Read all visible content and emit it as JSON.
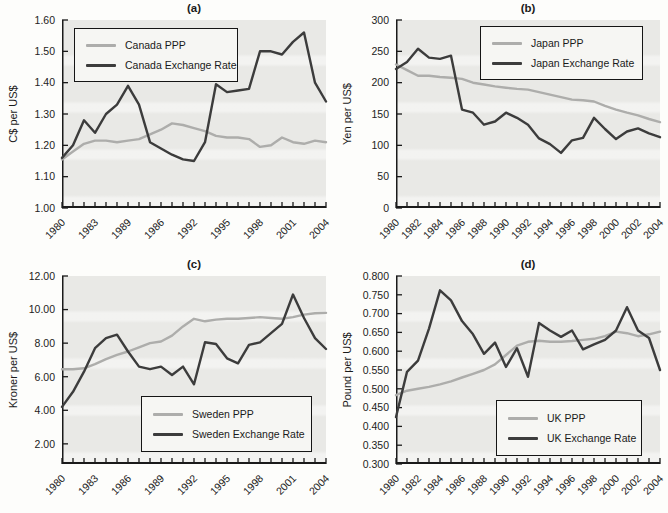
{
  "colors": {
    "ppp": "#adadab",
    "exchange": "#3c3c3c",
    "plot_bg": "#e9e9e6",
    "axis": "#1a1a1a",
    "text": "#222222"
  },
  "chart_data": [
    {
      "id": "a",
      "type": "line",
      "title": "(a)",
      "ylabel": "C$ per US$",
      "xlim": [
        1980,
        2004
      ],
      "ylim": [
        1.0,
        1.6
      ],
      "x_start": 1980,
      "x_step": 1,
      "grid": false,
      "legend_position": "top-left",
      "yticks": [
        {
          "v": 1.0,
          "label": "1.00"
        },
        {
          "v": 1.1,
          "label": "1.10"
        },
        {
          "v": 1.2,
          "label": "1.20"
        },
        {
          "v": 1.3,
          "label": "1.30"
        },
        {
          "v": 1.4,
          "label": "1.40"
        },
        {
          "v": 1.5,
          "label": "1.50"
        },
        {
          "v": 1.6,
          "label": "1.60"
        }
      ],
      "xticks": [
        {
          "pos": 1980,
          "label": "1980"
        },
        {
          "pos": 1983,
          "label": "1983"
        },
        {
          "pos": 1986,
          "label": "1989"
        },
        {
          "pos": 1989,
          "label": "1986"
        },
        {
          "pos": 1992,
          "label": "1992"
        },
        {
          "pos": 1995,
          "label": "1995"
        },
        {
          "pos": 1998,
          "label": "1998"
        },
        {
          "pos": 2001,
          "label": "2001"
        },
        {
          "pos": 2004,
          "label": "2004"
        }
      ],
      "series": [
        {
          "name": "Canada PPP",
          "color_key": "ppp",
          "values": [
            1.155,
            1.18,
            1.205,
            1.215,
            1.215,
            1.21,
            1.215,
            1.22,
            1.235,
            1.25,
            1.27,
            1.265,
            1.255,
            1.245,
            1.23,
            1.225,
            1.225,
            1.22,
            1.195,
            1.2,
            1.225,
            1.21,
            1.205,
            1.215,
            1.21
          ]
        },
        {
          "name": "Canada Exchange Rate",
          "color_key": "exchange",
          "values": [
            1.16,
            1.2,
            1.28,
            1.24,
            1.3,
            1.33,
            1.39,
            1.33,
            1.21,
            1.19,
            1.17,
            1.155,
            1.15,
            1.21,
            1.395,
            1.37,
            1.375,
            1.38,
            1.5,
            1.5,
            1.49,
            1.53,
            1.56,
            1.4,
            1.34
          ]
        }
      ]
    },
    {
      "id": "b",
      "type": "line",
      "title": "(b)",
      "ylabel": "Yen per US$",
      "xlim": [
        1980,
        2004
      ],
      "ylim": [
        0,
        300
      ],
      "x_start": 1980,
      "x_step": 1,
      "grid": false,
      "legend_position": "top-right",
      "yticks": [
        {
          "v": 0,
          "label": "0"
        },
        {
          "v": 50,
          "label": "50"
        },
        {
          "v": 100,
          "label": "100"
        },
        {
          "v": 150,
          "label": "150"
        },
        {
          "v": 200,
          "label": "200"
        },
        {
          "v": 250,
          "label": "250"
        },
        {
          "v": 300,
          "label": "300"
        }
      ],
      "xticks": [
        {
          "pos": 1980,
          "label": "1980"
        },
        {
          "pos": 1982,
          "label": "1982"
        },
        {
          "pos": 1984,
          "label": "1984"
        },
        {
          "pos": 1986,
          "label": "1986"
        },
        {
          "pos": 1988,
          "label": "1988"
        },
        {
          "pos": 1990,
          "label": "1990"
        },
        {
          "pos": 1992,
          "label": "1992"
        },
        {
          "pos": 1994,
          "label": "1994"
        },
        {
          "pos": 1996,
          "label": "1996"
        },
        {
          "pos": 1998,
          "label": "1998"
        },
        {
          "pos": 2000,
          "label": "2000"
        },
        {
          "pos": 2002,
          "label": "2002"
        },
        {
          "pos": 2004,
          "label": "2004"
        }
      ],
      "series": [
        {
          "name": "Japan PPP",
          "color_key": "ppp",
          "values": [
            229,
            220,
            211,
            211,
            209,
            208,
            206,
            200,
            197,
            194,
            192,
            190,
            189,
            185,
            181,
            177,
            173,
            172,
            170,
            163,
            157,
            152,
            148,
            142,
            137
          ]
        },
        {
          "name": "Japan Exchange Rate",
          "color_key": "exchange",
          "values": [
            222,
            233,
            254,
            240,
            238,
            243,
            157,
            152,
            133,
            138,
            152,
            144,
            133,
            111,
            102,
            88,
            108,
            112,
            144,
            126,
            110,
            122,
            127,
            119,
            113
          ]
        }
      ]
    },
    {
      "id": "c",
      "type": "line",
      "title": "(c)",
      "ylabel": "Kroner per US$",
      "xlim": [
        1980,
        2004
      ],
      "ylim": [
        0.8,
        12.0
      ],
      "x_start": 1980,
      "x_step": 1,
      "grid": false,
      "legend_position": "bottom-right",
      "yticks": [
        {
          "v": 2,
          "label": "2.00"
        },
        {
          "v": 4,
          "label": "4.00"
        },
        {
          "v": 6,
          "label": "6.00"
        },
        {
          "v": 8,
          "label": "8.00"
        },
        {
          "v": 10,
          "label": "10.00"
        },
        {
          "v": 12,
          "label": "12.00"
        }
      ],
      "xticks": [
        {
          "pos": 1980,
          "label": "1980"
        },
        {
          "pos": 1983,
          "label": "1983"
        },
        {
          "pos": 1986,
          "label": "1986"
        },
        {
          "pos": 1989,
          "label": "1989"
        },
        {
          "pos": 1992,
          "label": "1992"
        },
        {
          "pos": 1995,
          "label": "1995"
        },
        {
          "pos": 1998,
          "label": "1998"
        },
        {
          "pos": 2001,
          "label": "2001"
        },
        {
          "pos": 2004,
          "label": "2004"
        }
      ],
      "series": [
        {
          "name": "Sweden PPP",
          "color_key": "ppp",
          "values": [
            6.45,
            6.45,
            6.5,
            6.75,
            7.05,
            7.3,
            7.5,
            7.75,
            8.0,
            8.1,
            8.45,
            9.0,
            9.45,
            9.3,
            9.4,
            9.45,
            9.45,
            9.5,
            9.55,
            9.5,
            9.45,
            9.55,
            9.7,
            9.78,
            9.8
          ]
        },
        {
          "name": "Sweden Exchange Rate",
          "color_key": "exchange",
          "values": [
            4.2,
            5.1,
            6.3,
            7.7,
            8.3,
            8.5,
            7.5,
            6.6,
            6.45,
            6.6,
            6.1,
            6.6,
            5.55,
            8.05,
            7.95,
            7.1,
            6.8,
            7.9,
            8.05,
            8.6,
            9.15,
            10.9,
            9.5,
            8.3,
            7.65
          ]
        }
      ]
    },
    {
      "id": "d",
      "type": "line",
      "title": "(d)",
      "ylabel": "Pound per US$",
      "xlim": [
        1980,
        2004
      ],
      "ylim": [
        0.3,
        0.8
      ],
      "x_start": 1980,
      "x_step": 1,
      "grid": false,
      "legend_position": "bottom-right",
      "yticks": [
        {
          "v": 0.3,
          "label": "0.300"
        },
        {
          "v": 0.35,
          "label": "0.350"
        },
        {
          "v": 0.4,
          "label": "0.400"
        },
        {
          "v": 0.45,
          "label": "0.450"
        },
        {
          "v": 0.5,
          "label": "0.500"
        },
        {
          "v": 0.55,
          "label": "0.550"
        },
        {
          "v": 0.6,
          "label": "0.600"
        },
        {
          "v": 0.65,
          "label": "0.650"
        },
        {
          "v": 0.7,
          "label": "0.700"
        },
        {
          "v": 0.75,
          "label": "0.750"
        },
        {
          "v": 0.8,
          "label": "0.800"
        }
      ],
      "xticks": [
        {
          "pos": 1980,
          "label": "1980"
        },
        {
          "pos": 1982,
          "label": "1982"
        },
        {
          "pos": 1984,
          "label": "1984"
        },
        {
          "pos": 1986,
          "label": "1986"
        },
        {
          "pos": 1988,
          "label": "1988"
        },
        {
          "pos": 1990,
          "label": "1990"
        },
        {
          "pos": 1992,
          "label": "1992"
        },
        {
          "pos": 1994,
          "label": "1994"
        },
        {
          "pos": 1996,
          "label": "1996"
        },
        {
          "pos": 1998,
          "label": "1998"
        },
        {
          "pos": 2000,
          "label": "2000"
        },
        {
          "pos": 2002,
          "label": "2002"
        },
        {
          "pos": 2004,
          "label": "2004"
        }
      ],
      "series": [
        {
          "name": "UK PPP",
          "color_key": "ppp",
          "values": [
            0.483,
            0.495,
            0.5,
            0.505,
            0.512,
            0.52,
            0.53,
            0.54,
            0.55,
            0.565,
            0.59,
            0.615,
            0.625,
            0.628,
            0.625,
            0.625,
            0.627,
            0.63,
            0.633,
            0.64,
            0.652,
            0.648,
            0.64,
            0.645,
            0.652
          ]
        },
        {
          "name": "UK Exchange Rate",
          "color_key": "exchange",
          "values": [
            0.425,
            0.545,
            0.575,
            0.66,
            0.762,
            0.735,
            0.68,
            0.645,
            0.593,
            0.623,
            0.558,
            0.608,
            0.532,
            0.675,
            0.655,
            0.638,
            0.655,
            0.605,
            0.618,
            0.63,
            0.655,
            0.717,
            0.655,
            0.635,
            0.55
          ]
        }
      ]
    }
  ]
}
